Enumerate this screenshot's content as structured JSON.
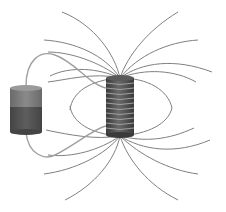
{
  "diagram": {
    "title": "",
    "labels": [],
    "components": [
      {
        "name": "battery",
        "type": "cylinder",
        "colors": {
          "top": "#8a8a8a",
          "upper": "#7d7d7d",
          "lower": "#5a5a5a"
        }
      },
      {
        "name": "solenoid",
        "type": "coil",
        "colors": {
          "core": "#4a4a4a",
          "winding": "#9a9a9a"
        }
      },
      {
        "name": "wires",
        "type": "connection",
        "colors": {
          "stroke": "#9a9a9a"
        }
      },
      {
        "name": "field-lines",
        "type": "magnetic-field",
        "colors": {
          "stroke": "#7a7a7a"
        }
      }
    ],
    "colors": {
      "background": "#ffffff",
      "field_line": "#808080",
      "wire": "#a0a0a0"
    }
  }
}
